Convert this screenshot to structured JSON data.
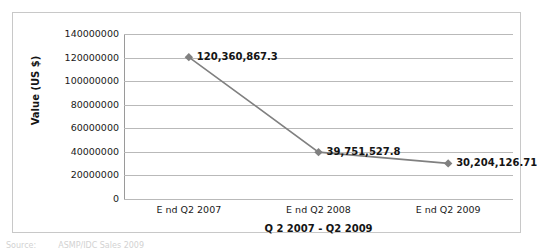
{
  "chart_data": {
    "type": "line",
    "title": "",
    "xlabel": "Q 2 2007 - Q2 2009",
    "ylabel": "Value (US $)",
    "categories": [
      "E nd Q2 2007",
      "E nd Q2 2008",
      "E nd Q2 2009"
    ],
    "values": [
      120360867.3,
      39751527.8,
      30204126.71
    ],
    "point_labels": [
      "120,360,867.3",
      "39,751,527.8",
      "30,204,126.71"
    ],
    "ylim": [
      0,
      140000000
    ],
    "ytick_labels": [
      "140000000",
      "120000000",
      "100000000",
      "80000000",
      "60000000",
      "40000000",
      "20000000",
      "0"
    ],
    "ytick_values": [
      140000000,
      120000000,
      100000000,
      80000000,
      60000000,
      40000000,
      20000000,
      0
    ],
    "grid": true,
    "legend": false,
    "series_color": "#808080",
    "marker": "diamond",
    "gridline_color": "#b9b9b9",
    "frame_color": "#c8c8c8"
  },
  "caption": {
    "label": "Source:",
    "text": "ASMP/IDC Sales 2009"
  }
}
